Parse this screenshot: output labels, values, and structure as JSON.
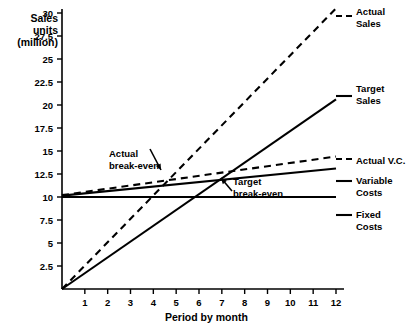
{
  "chart_data": {
    "type": "line",
    "title": "",
    "xlabel": "Period by month",
    "ylabel": "Sales units (million)",
    "x": [
      1,
      2,
      3,
      4,
      5,
      6,
      7,
      8,
      9,
      10,
      11,
      12
    ],
    "xlim": [
      0,
      12
    ],
    "ylim": [
      0,
      30
    ],
    "xticks": [
      "1",
      "2",
      "3",
      "4",
      "5",
      "6",
      "7",
      "8",
      "9",
      "10",
      "11",
      "12"
    ],
    "yticks": [
      "2.5",
      "5",
      "7.5",
      "10",
      "12.5",
      "15",
      "17.5",
      "20",
      "22.5",
      "25",
      "27.5",
      "30"
    ],
    "ytick_values": [
      2.5,
      5,
      7.5,
      10,
      12.5,
      15,
      17.5,
      20,
      22.5,
      25,
      27.5,
      30
    ],
    "grid": false,
    "legend_position": "right",
    "series": [
      {
        "name": "Actual Sales",
        "style": "dashed",
        "start": [
          0,
          0
        ],
        "end": [
          12,
          30.5
        ],
        "values": [
          2.54,
          5.08,
          7.62,
          10.17,
          12.71,
          15.25,
          17.79,
          20.33,
          22.88,
          25.42,
          27.96,
          30.5
        ]
      },
      {
        "name": "Target Sales",
        "style": "solid",
        "start": [
          0,
          0
        ],
        "end": [
          12,
          20.6
        ],
        "values": [
          1.72,
          3.43,
          5.15,
          6.87,
          8.58,
          10.3,
          12.02,
          13.73,
          15.45,
          17.17,
          18.88,
          20.6
        ]
      },
      {
        "name": "Actual V.C.",
        "style": "dashed",
        "start": [
          0,
          10.2
        ],
        "end": [
          12,
          14.4
        ],
        "values": [
          10.55,
          10.9,
          11.25,
          11.6,
          11.95,
          12.3,
          12.65,
          13.0,
          13.35,
          13.7,
          14.05,
          14.4
        ]
      },
      {
        "name": "Variable Costs",
        "style": "solid",
        "start": [
          0,
          10.15
        ],
        "end": [
          12,
          13.1
        ],
        "values": [
          10.4,
          10.64,
          10.89,
          11.13,
          11.38,
          11.62,
          11.87,
          12.11,
          12.36,
          12.6,
          12.85,
          13.1
        ]
      },
      {
        "name": "Fixed Costs",
        "style": "solid",
        "start": [
          0,
          10.0
        ],
        "end": [
          12,
          10.0
        ],
        "values": [
          10,
          10,
          10,
          10,
          10,
          10,
          10,
          10,
          10,
          10,
          10,
          10
        ]
      }
    ],
    "annotations": [
      {
        "label": "Actual\nbreak-even",
        "point_x": 5.0,
        "point_y": 12.1
      },
      {
        "label": "Target\nbreak-even",
        "point_x": 8.0,
        "point_y": 12.2
      }
    ]
  },
  "axis": {
    "y_title": "Sales\nunits\n(million)",
    "x_title": "Period by month"
  },
  "legend": {
    "items": [
      {
        "label": "Actual\nSales",
        "style": "dashed"
      },
      {
        "label": "Target\nSales",
        "style": "solid"
      },
      {
        "label": "Actual V.C.",
        "style": "dashed"
      },
      {
        "label": "Variable\nCosts",
        "style": "solid"
      },
      {
        "label": "Fixed\nCosts",
        "style": "solid"
      }
    ]
  },
  "annotations": {
    "actual_break_even": "Actual\nbreak-even",
    "target_break_even": "Target\nbreak-even"
  },
  "colors": {
    "ink": "#000000",
    "background": "#ffffff"
  }
}
